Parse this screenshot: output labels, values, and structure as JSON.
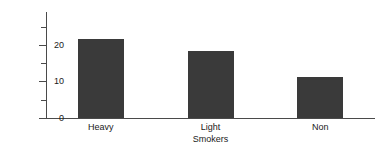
{
  "chart_data": {
    "type": "bar",
    "title": "",
    "categories": [
      "Heavy",
      "Light",
      "Non"
    ],
    "values": [
      21.5,
      18.3,
      11.3
    ],
    "xlabel": "Smokers",
    "ylabel": "Number of clients",
    "ylim": [
      0,
      29
    ],
    "ytick_major": [
      0,
      10,
      20
    ],
    "ytick_major_labels": [
      "0",
      "10",
      "20"
    ],
    "ytick_minor": [
      5,
      15,
      25
    ],
    "grid": false,
    "legend": null,
    "bar_color": "#3a3a3a",
    "axis_color": "#4a4a4a",
    "background": "#ffffff"
  },
  "axes": {
    "y_label": "Number of clients",
    "x_title": "Smokers",
    "tick_0": "0",
    "tick_10": "10",
    "tick_20": "20"
  },
  "bars": [
    {
      "label": "Heavy",
      "value": 21.5
    },
    {
      "label": "Light",
      "value": 18.3
    },
    {
      "label": "Non",
      "value": 11.3
    }
  ]
}
